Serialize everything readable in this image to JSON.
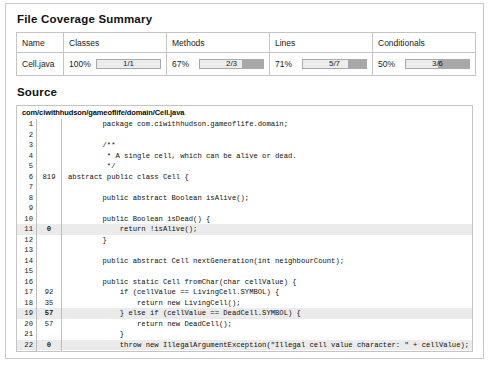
{
  "summary": {
    "heading": "File Coverage Summary",
    "columns": [
      "Name",
      "Classes",
      "Methods",
      "Lines",
      "Conditionals"
    ],
    "row": {
      "name": "Cell.java",
      "metrics": [
        {
          "key": "classes",
          "percent": "100%",
          "pct_value": 100,
          "ratio": "1/1"
        },
        {
          "key": "methods",
          "percent": "67%",
          "pct_value": 67,
          "ratio": "2/3"
        },
        {
          "key": "lines",
          "percent": "71%",
          "pct_value": 71,
          "ratio": "5/7"
        },
        {
          "key": "conditionals",
          "percent": "50%",
          "pct_value": 50,
          "ratio": "3/6"
        }
      ]
    }
  },
  "source": {
    "heading": "Source",
    "path": "com/ciwithhudson/gameoflife/domain/Cell.java",
    "lines": [
      {
        "n": "1",
        "count": "",
        "text": "        package com.ciwithhudson.gameoflife.domain;",
        "hit": false
      },
      {
        "n": "2",
        "count": "",
        "text": "",
        "hit": false
      },
      {
        "n": "3",
        "count": "",
        "text": "        /**",
        "hit": false
      },
      {
        "n": "4",
        "count": "",
        "text": "         * A single cell, which can be alive or dead.",
        "hit": false
      },
      {
        "n": "5",
        "count": "",
        "text": "         */",
        "hit": false
      },
      {
        "n": "6",
        "count": "819",
        "text": "abstract public class Cell {",
        "hit": false
      },
      {
        "n": "7",
        "count": "",
        "text": "",
        "hit": false
      },
      {
        "n": "8",
        "count": "",
        "text": "        public abstract Boolean isAlive();",
        "hit": false
      },
      {
        "n": "9",
        "count": "",
        "text": "",
        "hit": false
      },
      {
        "n": "10",
        "count": "",
        "text": "        public Boolean isDead() {",
        "hit": false
      },
      {
        "n": "11",
        "count": "0",
        "text": "            return !isAlive();",
        "hit": true
      },
      {
        "n": "12",
        "count": "",
        "text": "        }",
        "hit": false
      },
      {
        "n": "13",
        "count": "",
        "text": "",
        "hit": false
      },
      {
        "n": "14",
        "count": "",
        "text": "        public abstract Cell nextGeneration(int neighbourCount);",
        "hit": false
      },
      {
        "n": "15",
        "count": "",
        "text": "",
        "hit": false
      },
      {
        "n": "16",
        "count": "",
        "text": "        public static Cell fromChar(char cellValue) {",
        "hit": false
      },
      {
        "n": "17",
        "count": "92",
        "text": "            if (cellValue == LivingCell.SYMBOL) {",
        "hit": false
      },
      {
        "n": "18",
        "count": "35",
        "text": "                return new LivingCell();",
        "hit": false
      },
      {
        "n": "19",
        "count": "57",
        "text": "            } else if (cellValue == DeadCell.SYMBOL) {",
        "hit": true
      },
      {
        "n": "20",
        "count": "57",
        "text": "                return new DeadCell();",
        "hit": false
      },
      {
        "n": "21",
        "count": "",
        "text": "            }",
        "hit": false
      },
      {
        "n": "22",
        "count": "0",
        "text": "            throw new IllegalArgumentException(\"Illegal cell value character: \" + cellValue);",
        "hit": true
      },
      {
        "n": "23",
        "count": "",
        "text": "        }",
        "hit": false
      },
      {
        "n": "24",
        "count": "",
        "text": "",
        "hit": false
      },
      {
        "n": "25",
        "count": "",
        "text": "    }",
        "hit": false
      }
    ]
  },
  "colors": {
    "bar_covered": "#ececec",
    "bar_uncovered": "#a8a8a8",
    "bar_border": "#a9a9a9",
    "row_highlight": "#ebebeb",
    "panel_border": "#c9c9c9"
  }
}
